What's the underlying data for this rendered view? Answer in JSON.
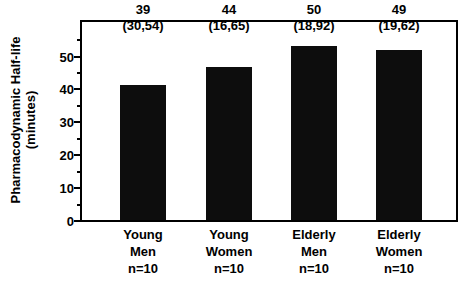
{
  "chart_data": {
    "type": "bar",
    "title": "",
    "xlabel": "",
    "ylabel": "Pharmacodynamic Half-life (minutes)",
    "ylabel_line1": "Pharmacodynamic Half-life",
    "ylabel_line2": "(minutes)",
    "ylim": [
      0,
      57
    ],
    "yticks": [
      0,
      10,
      20,
      30,
      40,
      50
    ],
    "ytick_labels": [
      "0",
      "10",
      "20",
      "30",
      "40",
      "50"
    ],
    "minor_ticks": [
      5,
      15,
      25,
      35,
      45,
      55
    ],
    "grid": false,
    "legend": "none",
    "bar_color": "#0d0d0d",
    "categories": [
      "Young Men n=10",
      "Young Women n=10",
      "Elderly Men n=10",
      "Elderly Women n=10"
    ],
    "values": [
      39,
      44,
      50,
      49
    ],
    "value_labels": [
      "39",
      "44",
      "50",
      "49"
    ],
    "range_labels": [
      "(30,54)",
      "(16,65)",
      "(18,92)",
      "(19,62)"
    ],
    "ranges": [
      [
        30,
        54
      ],
      [
        16,
        65
      ],
      [
        18,
        92
      ],
      [
        19,
        62
      ]
    ],
    "n_labels": [
      "n=10",
      "n=10",
      "n=10",
      "n=10"
    ],
    "category_lines": [
      [
        "Young",
        "Men",
        "n=10"
      ],
      [
        "Young",
        "Women",
        "n=10"
      ],
      [
        "Elderly",
        "Men",
        "n=10"
      ],
      [
        "Elderly",
        "Women",
        "n=10"
      ]
    ]
  }
}
